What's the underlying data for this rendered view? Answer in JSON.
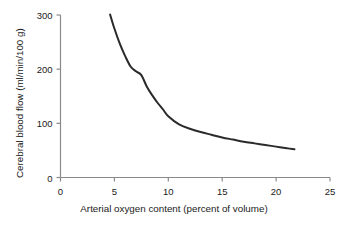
{
  "chart_data": {
    "type": "line",
    "title": "",
    "xlabel": "Arterial oxygen content (percent of volume)",
    "ylabel": "Cerebral blood flow (ml/min/100 g)",
    "xlim": [
      0,
      25
    ],
    "ylim": [
      0,
      300
    ],
    "xticks": [
      0,
      5,
      10,
      15,
      20,
      25
    ],
    "yticks": [
      0,
      100,
      200,
      300
    ],
    "xtick_labels": [
      "0",
      "5",
      "10",
      "15",
      "20",
      "25"
    ],
    "ytick_labels": [
      "0",
      "100",
      "200",
      "300"
    ],
    "grid": false,
    "legend": null,
    "series": [
      {
        "name": "Cerebral blood flow",
        "color": "#2a2a2a",
        "line_width": 2,
        "x": [
          4.6,
          5.0,
          5.5,
          6.0,
          6.5,
          7.0,
          7.5,
          8.0,
          8.5,
          9.0,
          9.5,
          10.0,
          11.0,
          12.0,
          13.0,
          14.0,
          15.0,
          16.0,
          17.0,
          18.0,
          19.0,
          20.0,
          21.0,
          21.7
        ],
        "y": [
          301,
          275,
          247,
          224,
          205,
          196,
          189,
          168,
          152,
          138,
          126,
          113,
          98,
          90,
          84,
          79,
          74,
          70,
          66,
          63,
          60,
          57,
          54,
          52
        ]
      }
    ],
    "annotations": []
  },
  "axes": {
    "axis_color": "#8a8a8a",
    "tick_color": "#8a8a8a",
    "text_color": "#1a1a1a"
  }
}
